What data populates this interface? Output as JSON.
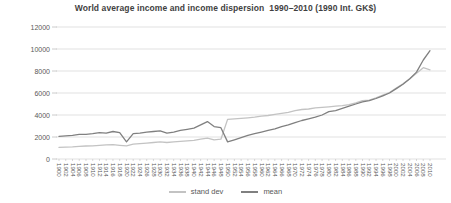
{
  "colors": {
    "background": "#ffffff",
    "gridline": "#d9d9d9",
    "tick": "#bfbfbf",
    "axis_text": "#595959",
    "title_text": "#3f3f3f",
    "stand_dev_line": "#c3c3c3",
    "mean_line": "#808080"
  },
  "chart_data": {
    "type": "line",
    "title": "World average income and income dispersion  1990–2010 (1990 Int. GK$)",
    "xlabel": "",
    "ylabel": "",
    "ylim": [
      0,
      12000
    ],
    "yticks": [
      0,
      2000,
      4000,
      6000,
      8000,
      10000,
      12000
    ],
    "grid": true,
    "legend_position": "bottom",
    "x": [
      1900,
      1902,
      1904,
      1906,
      1908,
      1910,
      1912,
      1914,
      1916,
      1918,
      1920,
      1922,
      1924,
      1926,
      1928,
      1930,
      1932,
      1934,
      1936,
      1938,
      1940,
      1942,
      1944,
      1946,
      1948,
      1950,
      1952,
      1954,
      1956,
      1958,
      1960,
      1962,
      1964,
      1966,
      1968,
      1970,
      1972,
      1974,
      1976,
      1978,
      1980,
      1982,
      1984,
      1986,
      1988,
      1990,
      1992,
      1994,
      1996,
      1998,
      2000,
      2002,
      2004,
      2006,
      2008,
      2010
    ],
    "series": [
      {
        "name": "stand dev",
        "color": "#c3c3c3",
        "values": [
          1050,
          1080,
          1100,
          1150,
          1180,
          1200,
          1250,
          1280,
          1300,
          1250,
          1200,
          1350,
          1400,
          1450,
          1500,
          1550,
          1500,
          1550,
          1600,
          1650,
          1700,
          1800,
          1900,
          1750,
          1800,
          3600,
          3650,
          3700,
          3750,
          3800,
          3900,
          3950,
          4050,
          4150,
          4250,
          4400,
          4500,
          4550,
          4650,
          4700,
          4750,
          4800,
          4850,
          4950,
          5100,
          5300,
          5350,
          5550,
          5800,
          6050,
          6450,
          6850,
          7300,
          7800,
          8300,
          8100
        ]
      },
      {
        "name": "mean",
        "color": "#808080",
        "values": [
          2050,
          2100,
          2150,
          2250,
          2250,
          2300,
          2400,
          2350,
          2500,
          2400,
          1550,
          2300,
          2350,
          2450,
          2500,
          2550,
          2350,
          2450,
          2600,
          2700,
          2800,
          3100,
          3400,
          2950,
          2850,
          1550,
          1750,
          1950,
          2150,
          2300,
          2450,
          2600,
          2750,
          2950,
          3100,
          3300,
          3500,
          3650,
          3800,
          4000,
          4300,
          4400,
          4600,
          4800,
          5000,
          5200,
          5300,
          5500,
          5750,
          6000,
          6400,
          6800,
          7300,
          7900,
          9000,
          9850
        ]
      }
    ]
  }
}
